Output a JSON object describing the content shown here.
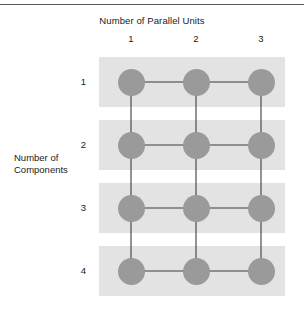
{
  "figure": {
    "column_axis_title": "Number of Parallel Units",
    "row_axis_title_line1": "Number of",
    "row_axis_title_line2": "Components",
    "column_headers": [
      "1",
      "2",
      "3"
    ],
    "row_headers": [
      "1",
      "2",
      "3",
      "4"
    ]
  },
  "chart_data": {
    "type": "scatter",
    "title": "",
    "xlabel": "Number of Parallel Units",
    "ylabel": "Number of Components",
    "x": [
      1,
      2,
      3
    ],
    "y": [
      1,
      2,
      3,
      4
    ],
    "xtick_labels": [
      "1",
      "2",
      "3"
    ],
    "ytick_labels": [
      "1",
      "2",
      "3",
      "4"
    ],
    "grid": false,
    "legend": "none",
    "node_color": "#9a9a9a",
    "edge_color": "#3c3c3c",
    "band_color": "#e3e3e3",
    "nodes": [
      {
        "col": 1,
        "row": 1
      },
      {
        "col": 2,
        "row": 1
      },
      {
        "col": 3,
        "row": 1
      },
      {
        "col": 1,
        "row": 2
      },
      {
        "col": 2,
        "row": 2
      },
      {
        "col": 3,
        "row": 2
      },
      {
        "col": 1,
        "row": 3
      },
      {
        "col": 2,
        "row": 3
      },
      {
        "col": 3,
        "row": 3
      },
      {
        "col": 1,
        "row": 4
      },
      {
        "col": 2,
        "row": 4
      },
      {
        "col": 3,
        "row": 4
      }
    ],
    "edges": [
      {
        "from": [
          1,
          1
        ],
        "to": [
          2,
          1
        ]
      },
      {
        "from": [
          2,
          1
        ],
        "to": [
          3,
          1
        ]
      },
      {
        "from": [
          1,
          2
        ],
        "to": [
          2,
          2
        ]
      },
      {
        "from": [
          2,
          2
        ],
        "to": [
          3,
          2
        ]
      },
      {
        "from": [
          1,
          3
        ],
        "to": [
          2,
          3
        ]
      },
      {
        "from": [
          2,
          3
        ],
        "to": [
          3,
          3
        ]
      },
      {
        "from": [
          1,
          4
        ],
        "to": [
          2,
          4
        ]
      },
      {
        "from": [
          2,
          4
        ],
        "to": [
          3,
          4
        ]
      },
      {
        "from": [
          1,
          1
        ],
        "to": [
          1,
          2
        ]
      },
      {
        "from": [
          1,
          2
        ],
        "to": [
          1,
          3
        ]
      },
      {
        "from": [
          1,
          3
        ],
        "to": [
          1,
          4
        ]
      },
      {
        "from": [
          2,
          1
        ],
        "to": [
          2,
          2
        ]
      },
      {
        "from": [
          2,
          2
        ],
        "to": [
          2,
          3
        ]
      },
      {
        "from": [
          2,
          3
        ],
        "to": [
          2,
          4
        ]
      },
      {
        "from": [
          3,
          1
        ],
        "to": [
          3,
          2
        ]
      },
      {
        "from": [
          3,
          2
        ],
        "to": [
          3,
          3
        ]
      },
      {
        "from": [
          3,
          3
        ],
        "to": [
          3,
          4
        ]
      }
    ]
  }
}
